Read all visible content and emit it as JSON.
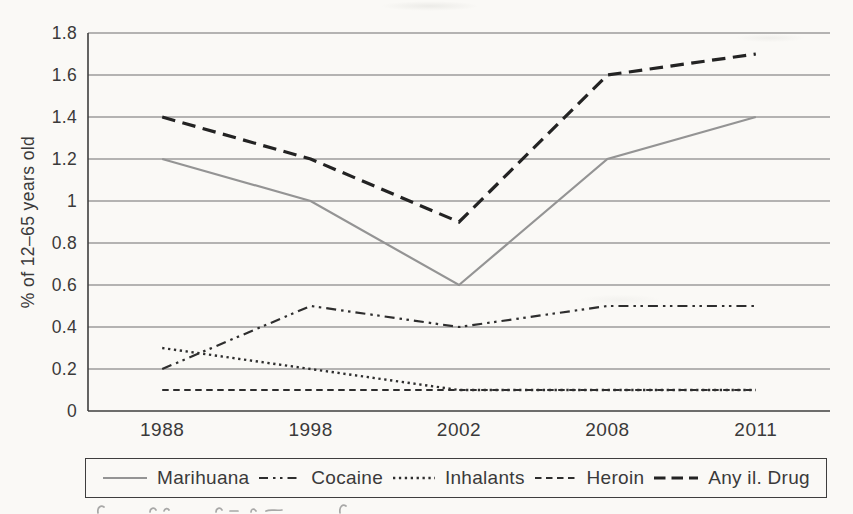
{
  "figure": {
    "background": "#faf9f6",
    "grid_color": "#6f6f6f",
    "axis_color": "#3e3e3e",
    "text_color": "#3a3a3a",
    "legend_border_color": "#3e3e3e"
  },
  "chart_data": {
    "type": "line",
    "title": "",
    "xlabel": "",
    "ylabel": "% of 12–65 years old",
    "categories": [
      "1988",
      "1998",
      "2002",
      "2008",
      "2011"
    ],
    "series": [
      {
        "name": "Marihuana",
        "values": [
          1.2,
          1.0,
          0.6,
          1.2,
          1.4
        ],
        "color": "#949494",
        "dash": "solid",
        "width": 2.2
      },
      {
        "name": "Cocaine",
        "values": [
          0.2,
          0.5,
          0.4,
          0.5,
          0.5
        ],
        "color": "#2e2e2e",
        "dash": "dash-dot-dot",
        "width": 2.2
      },
      {
        "name": "Inhalants",
        "values": [
          0.3,
          0.2,
          0.1,
          0.1,
          0.1
        ],
        "color": "#2e2e2e",
        "dash": "dotted",
        "width": 2.4
      },
      {
        "name": "Heroin",
        "values": [
          0.1,
          0.1,
          0.1,
          0.1,
          0.1
        ],
        "color": "#2e2e2e",
        "dash": "short-dash",
        "width": 2.0
      },
      {
        "name": "Any il. Drug",
        "values": [
          1.4,
          1.2,
          0.9,
          1.6,
          1.7
        ],
        "color": "#232323",
        "dash": "long-dash",
        "width": 3.2
      }
    ],
    "ylim": [
      0,
      1.8
    ],
    "ytick_step": 0.2,
    "ytick_labels": [
      "0",
      "0.2",
      "0.4",
      "0.6",
      "0.8",
      "1",
      "1.2",
      "1.4",
      "1.6",
      "1.8"
    ],
    "grid": "horizontal-only",
    "legend_position": "bottom"
  }
}
